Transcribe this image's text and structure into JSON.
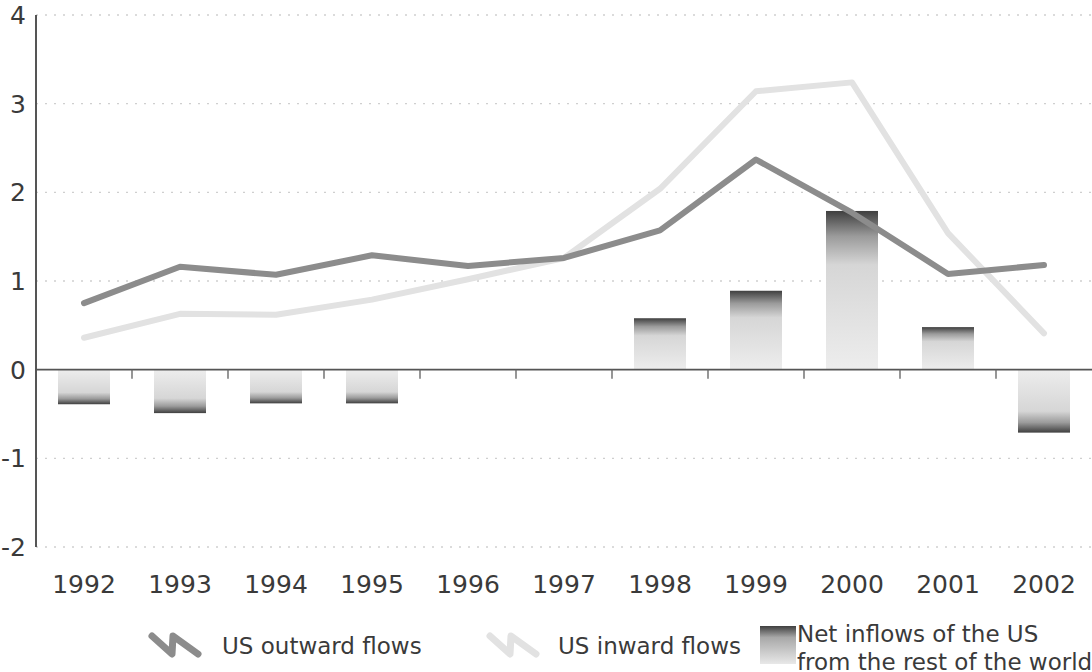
{
  "chart_data": {
    "type": "bar",
    "title": "",
    "subtitle": "",
    "xlabel": "",
    "ylabel": "",
    "categories": [
      "1992",
      "1993",
      "1994",
      "1995",
      "1996",
      "1997",
      "1998",
      "1999",
      "2000",
      "2001",
      "2002"
    ],
    "ylim": [
      -2,
      4
    ],
    "yticks": [
      "-2",
      "-1",
      "0",
      "1",
      "2",
      "3",
      "4"
    ],
    "ytick_values": [
      -2,
      -1,
      0,
      1,
      2,
      3,
      4
    ],
    "grid": true,
    "legend_position": "bottom",
    "series": [
      {
        "name": "US outward flows",
        "type": "line",
        "color": "#8c8c8c",
        "values": [
          0.75,
          1.16,
          1.07,
          1.29,
          1.17,
          1.26,
          1.57,
          2.37,
          1.77,
          1.08,
          1.18
        ]
      },
      {
        "name": "US inward flows",
        "type": "line",
        "color": "#e2e2e2",
        "values": [
          0.36,
          0.63,
          0.62,
          0.79,
          1.02,
          1.26,
          2.04,
          3.14,
          3.24,
          1.54,
          0.41
        ]
      },
      {
        "name": "Net inflows of the US from the rest of the world",
        "type": "bar",
        "color": "#bdbdbd",
        "values": [
          -0.39,
          -0.49,
          -0.38,
          -0.38,
          0.0,
          0.0,
          0.58,
          0.89,
          1.79,
          0.48,
          -0.71
        ]
      }
    ]
  },
  "legend": {
    "items": [
      {
        "label": "US outward flows",
        "marker": "zigzag-line-dark-icon"
      },
      {
        "label": "US inward flows",
        "marker": "zigzag-line-light-icon"
      },
      {
        "label": "Net inflows of the US\nfrom the rest of the world",
        "marker": "bar-swatch-icon",
        "line1": "Net inflows of the US",
        "line2": "from the rest of the world"
      }
    ]
  },
  "axes": {
    "y_axis_color": "#555555",
    "zero_line_color": "#555555",
    "grid_color": "#cfcfcf"
  }
}
